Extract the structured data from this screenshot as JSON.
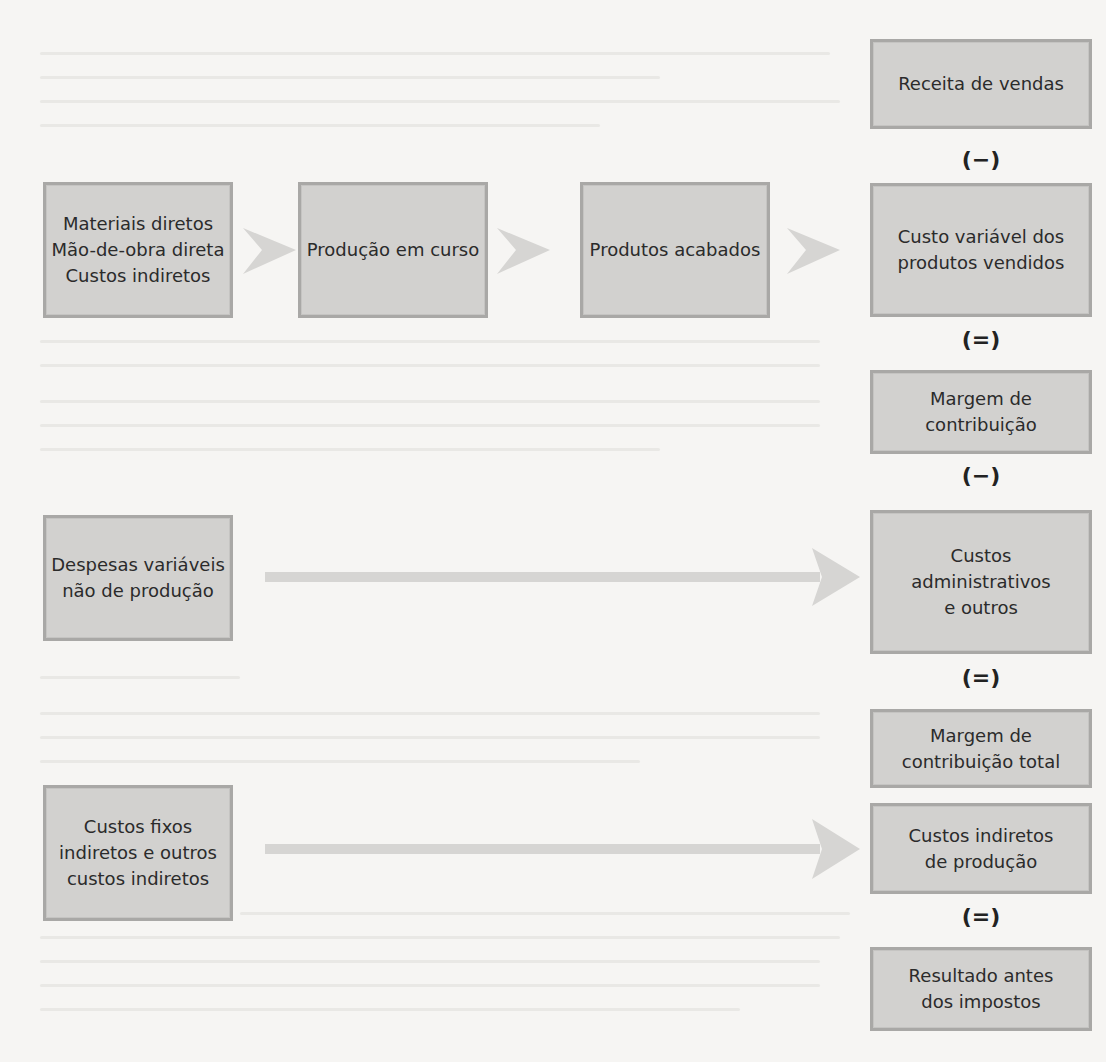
{
  "diagram": {
    "colors": {
      "box_fill": "#d2d1cf",
      "box_border": "#a9a8a6",
      "arrow_fill": "#d6d5d3",
      "text": "#2b2b2b",
      "background": "#f6f5f3"
    },
    "flow_row": {
      "inputs": [
        "Materiais diretos",
        "Mão-de-obra direta",
        "Custos indiretos"
      ],
      "work_in_progress": "Produção em curso",
      "finished_goods": "Produtos acabados"
    },
    "left_boxes": {
      "variable_non_production": [
        "Despesas variáveis",
        "não de produção"
      ],
      "fixed_costs": [
        "Custos fixos",
        "indiretos e outros",
        "custos indiretos"
      ]
    },
    "income_statement": {
      "sales_revenue": "Receita de vendas",
      "op1": "(−)",
      "variable_cogs": [
        "Custo variável dos",
        "produtos vendidos"
      ],
      "op2": "(=)",
      "contribution_margin": [
        "Margem de",
        "contribuição"
      ],
      "op3": "(−)",
      "admin_costs": [
        "Custos",
        "administrativos",
        "e outros"
      ],
      "op4": "(=)",
      "total_contribution_margin": [
        "Margem de",
        "contribuição total"
      ],
      "indirect_production_costs": [
        "Custos indiretos",
        "de produção"
      ],
      "op5": "(=)",
      "result_before_taxes": [
        "Resultado antes",
        "dos impostos"
      ]
    }
  }
}
